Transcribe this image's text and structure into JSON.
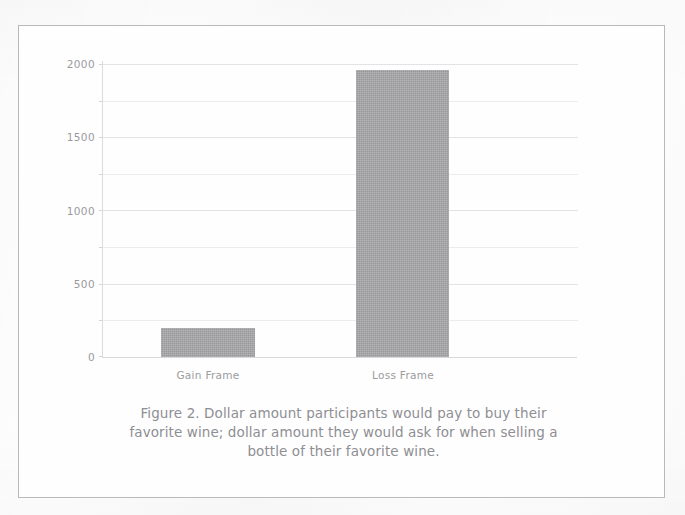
{
  "figure": {
    "caption_lines": [
      "Figure 2. Dollar amount participants would pay to buy their",
      "favorite wine; dollar amount they would ask for when selling a",
      "bottle of their favorite wine."
    ]
  },
  "colors": {
    "bar_fill": "#a3a3a5",
    "gridline": "#ececee",
    "axis": "#d9d9dc",
    "tick_text": "#9a9a9e",
    "caption_text": "#8e8e93",
    "frame_border": "#b9b9bb",
    "page_background": "#fdfdfd"
  },
  "chart_data": {
    "type": "bar",
    "title": "",
    "subtitle": "",
    "xlabel": "",
    "ylabel": "",
    "categories": [
      "Gain Frame",
      "Loss Frame"
    ],
    "values": [
      200,
      1960
    ],
    "series": [
      {
        "name": "Dollar amount",
        "values": [
          200,
          1960
        ]
      }
    ],
    "ylim": [
      0,
      2000
    ],
    "ytick_labels": [
      "2000",
      "1500",
      "1000",
      "500",
      "0"
    ],
    "ytick_values": [
      2000,
      1500,
      1000,
      500,
      0
    ],
    "minor_gridline_values": [
      1750,
      1250,
      750,
      250
    ],
    "grid": true,
    "grid_orientation": "horizontal",
    "legend": false,
    "legend_position": "none",
    "annotations": []
  }
}
